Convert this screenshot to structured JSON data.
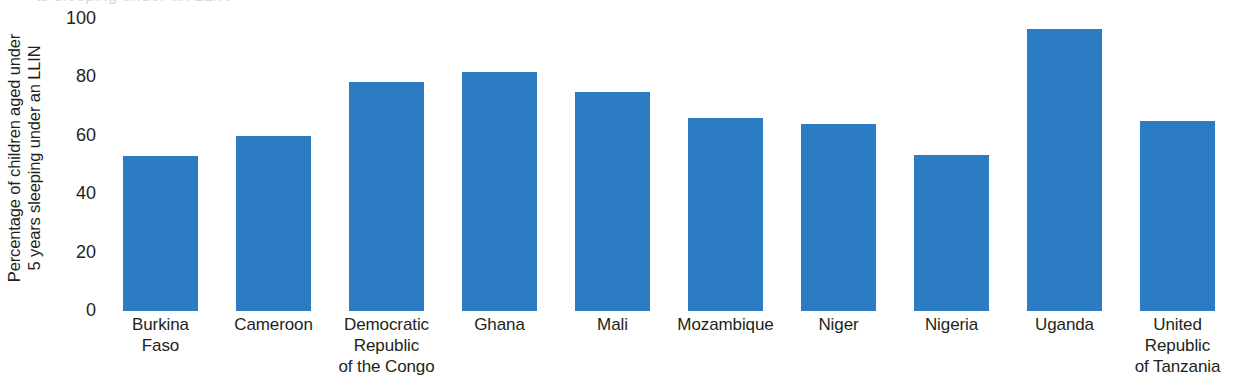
{
  "chart_data": {
    "type": "bar",
    "title": "",
    "xlabel": "",
    "ylabel_line1": "Percentage of children aged under",
    "ylabel_line2": "5 years sleeping under an LLIN",
    "ylabel": "Percentage of children aged under 5 years sleeping under an LLIN",
    "categories": [
      "Burkina Faso",
      "Cameroon",
      "Democratic Republic of the Congo",
      "Ghana",
      "Mali",
      "Mozambique",
      "Niger",
      "Nigeria",
      "Uganda",
      "United Republic of Tanzania"
    ],
    "category_lines": [
      [
        "Burkina",
        "Faso"
      ],
      [
        "Cameroon"
      ],
      [
        "Democratic",
        "Republic",
        "of the Congo"
      ],
      [
        "Ghana"
      ],
      [
        "Mali"
      ],
      [
        "Mozambique"
      ],
      [
        "Niger"
      ],
      [
        "Nigeria"
      ],
      [
        "Uganda"
      ],
      [
        "United",
        "Republic",
        "of Tanzania"
      ]
    ],
    "values": [
      53,
      60,
      78.5,
      82,
      75,
      66,
      64,
      53.5,
      96.5,
      65
    ],
    "ylim": [
      0,
      100
    ],
    "yticks": [
      100,
      80,
      60,
      40,
      20,
      0
    ],
    "ytick_labels": [
      "100",
      "80",
      "60",
      "40",
      "20",
      "0"
    ],
    "grid": false,
    "legend": false,
    "bar_color": "#2b7cc2",
    "axis_text_color": "#231f20"
  },
  "top_clipped_text": "ts sleeping under an LLIN"
}
